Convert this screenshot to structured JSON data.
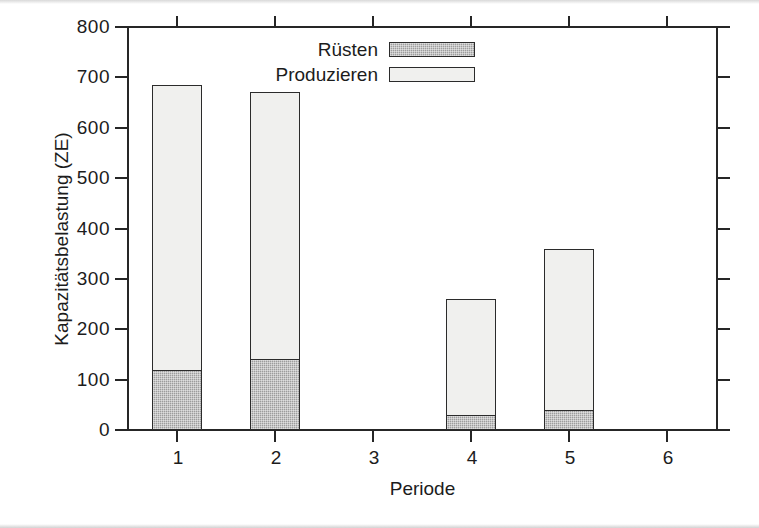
{
  "figure": {
    "background_color": "#ffffff",
    "line_color": "#262626"
  },
  "chart_data": {
    "type": "bar",
    "stacked": true,
    "title": "",
    "xlabel": "Periode",
    "ylabel": "Kapazitätsbelastung (ZE)",
    "categories": [
      "1",
      "2",
      "3",
      "4",
      "5",
      "6"
    ],
    "series": [
      {
        "name": "Rüsten",
        "color": "#9d9d9d",
        "values": [
          120,
          140,
          0,
          30,
          40,
          0
        ]
      },
      {
        "name": "Produzieren",
        "color": "#f0f0ee",
        "values": [
          565,
          530,
          0,
          230,
          320,
          0
        ]
      }
    ],
    "totals": [
      685,
      670,
      0,
      260,
      360,
      0
    ],
    "ylim": [
      0,
      800
    ],
    "yticks": [
      0,
      100,
      200,
      300,
      400,
      500,
      600,
      700,
      800
    ],
    "ytick_labels": [
      "0",
      "100",
      "200",
      "300",
      "400",
      "500",
      "600",
      "700",
      "800"
    ],
    "xtick_labels": [
      "1",
      "2",
      "3",
      "4",
      "5",
      "6"
    ],
    "grid": false,
    "legend_position": "top-center",
    "legend_entries": [
      {
        "label": "Rüsten",
        "swatch": "ruesten"
      },
      {
        "label": "Produzieren",
        "swatch": "produzieren"
      }
    ]
  },
  "axes": {
    "y_title": "Kapazitätsbelastung (ZE)",
    "x_title": "Periode",
    "y_labels": [
      "800",
      "700",
      "600",
      "500",
      "400",
      "300",
      "200",
      "100",
      "0"
    ],
    "x_labels": [
      "1",
      "2",
      "3",
      "4",
      "5",
      "6"
    ]
  },
  "legend": {
    "rows": [
      {
        "label": "Rüsten"
      },
      {
        "label": "Produzieren"
      }
    ]
  }
}
